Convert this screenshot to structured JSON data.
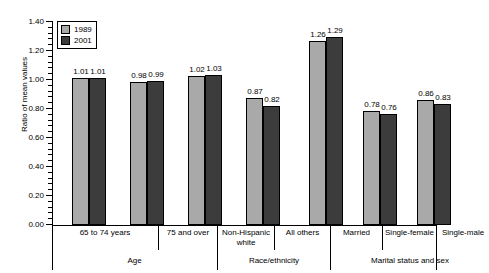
{
  "chart_data": {
    "type": "bar",
    "title": "",
    "xlabel": "",
    "ylabel": "Ratio of mean values",
    "ylim": [
      0.0,
      1.4
    ],
    "ytick_labels": [
      "1.40",
      "1.20",
      "1.00",
      "0.80",
      "0.60",
      "0.40",
      "0.20",
      "0.00"
    ],
    "ytick_values": [
      1.4,
      1.2,
      1.0,
      0.8,
      0.6,
      0.4,
      0.2,
      0.0
    ],
    "grid": false,
    "legend_position": "top-left",
    "categories": [
      "65 to 74 years",
      "75 and over",
      "Non-Hispanic white",
      "All others",
      "Married",
      "Single-female",
      "Single-male"
    ],
    "series": [
      {
        "name": "1989",
        "color": "#a9a9a9",
        "values": [
          1.01,
          0.98,
          1.02,
          0.87,
          1.26,
          0.78,
          0.86
        ]
      },
      {
        "name": "2001",
        "color": "#3c3c3c",
        "values": [
          1.01,
          0.99,
          1.03,
          0.82,
          1.29,
          0.76,
          0.83
        ]
      }
    ],
    "value_labels": [
      [
        "1.01",
        "1.01"
      ],
      [
        "0.98",
        "0.99"
      ],
      [
        "1.02",
        "1.03"
      ],
      [
        "0.87",
        "0.82"
      ],
      [
        "1.26",
        "1.29"
      ],
      [
        "0.78",
        "0.76"
      ],
      [
        "0.86",
        "0.83"
      ]
    ],
    "super_groups": [
      {
        "label": "Age",
        "categories": [
          "65 to 74 years",
          "75 and over"
        ]
      },
      {
        "label": "Race/ethnicity",
        "categories": [
          "Non-Hispanic white",
          "All others"
        ]
      },
      {
        "label": "Marital status and sex",
        "categories": [
          "Married",
          "Single-female",
          "Single-male"
        ]
      }
    ]
  },
  "legend": {
    "items": [
      {
        "label": "1989",
        "swatch": "light-gray-swatch"
      },
      {
        "label": "2001",
        "swatch": "dark-gray-swatch"
      }
    ]
  },
  "axis": {
    "y_title": "Ratio of mean values",
    "y_labels": [
      "1.40",
      "1.20",
      "1.00",
      "0.80",
      "0.60",
      "0.40",
      "0.20",
      "0.00"
    ]
  },
  "category_labels": [
    "65 to 74 years",
    "75 and over",
    "Non-Hispanic white",
    "All others",
    "Married",
    "Single-female",
    "Single-male"
  ],
  "group_labels": [
    "Age",
    "Race/ethnicity",
    "Marital status and sex"
  ]
}
